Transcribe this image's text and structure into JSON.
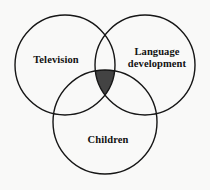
{
  "diagram": {
    "type": "venn-3-set",
    "background_color": "#f9f9f8",
    "stroke_color": "#161616",
    "stroke_width": 1.4,
    "intersection_fill": "#434343",
    "sets": [
      {
        "id": "television",
        "label": "Television",
        "cx": 65,
        "cy": 65,
        "r": 50
      },
      {
        "id": "language-development",
        "label": "Language\ndevelopment",
        "cx": 145,
        "cy": 65,
        "r": 50
      },
      {
        "id": "children",
        "label": "Children",
        "cx": 105,
        "cy": 122,
        "r": 52
      }
    ],
    "shaded_region": {
      "name": "triple-intersection",
      "description": "Television ∩ Language development ∩ Children",
      "fill": "#434343"
    }
  }
}
